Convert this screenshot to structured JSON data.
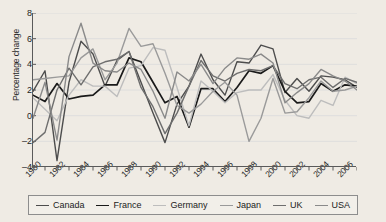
{
  "chart_data": {
    "type": "line",
    "title": "",
    "xlabel": "",
    "ylabel": "Percentage change",
    "xlim": [
      1980,
      2007
    ],
    "ylim": [
      -4,
      8
    ],
    "yticks": [
      -4,
      -2,
      0,
      2,
      4,
      6,
      8
    ],
    "xticks": [
      1980,
      1981,
      1982,
      1983,
      1984,
      1985,
      1986,
      1987,
      1988,
      1989,
      1990,
      1991,
      1992,
      1993,
      1994,
      1995,
      1996,
      1997,
      1998,
      1999,
      2000,
      2001,
      2002,
      2003,
      2004,
      2005,
      2006,
      2007
    ],
    "xtick_labels": [
      "1980",
      "1982",
      "1984",
      "1986",
      "1988",
      "1990",
      "1992",
      "1994",
      "1996",
      "1998",
      "2000",
      "2002",
      "2004",
      "2006"
    ],
    "xtick_label_years": [
      1980,
      1982,
      1984,
      1986,
      1988,
      1990,
      1992,
      1994,
      1996,
      1998,
      2000,
      2002,
      2004,
      2006
    ],
    "grid": "horizontal",
    "legend_position": "bottom",
    "x": [
      1980,
      1981,
      1982,
      1983,
      1984,
      1985,
      1986,
      1987,
      1988,
      1989,
      1990,
      1991,
      1992,
      1993,
      1994,
      1995,
      1996,
      1997,
      1998,
      1999,
      2000,
      2001,
      2002,
      2003,
      2004,
      2005,
      2006,
      2007
    ],
    "series": [
      {
        "name": "Canada",
        "color": "#4d4d4d",
        "values": [
          1.9,
          3.5,
          -3.5,
          2.6,
          5.8,
          4.8,
          2.3,
          4.3,
          5.0,
          2.6,
          0.2,
          -2.1,
          0.9,
          2.3,
          4.8,
          2.8,
          1.6,
          4.2,
          4.1,
          5.5,
          5.2,
          1.8,
          2.9,
          1.9,
          3.1,
          3.0,
          2.8,
          2.2
        ],
        "linewidth": 1.4
      },
      {
        "name": "France",
        "color": "#1a1a1a",
        "values": [
          1.6,
          1.1,
          2.5,
          1.3,
          1.5,
          1.6,
          2.4,
          2.4,
          4.5,
          4.2,
          2.6,
          1.0,
          1.5,
          -0.9,
          2.1,
          2.1,
          1.1,
          2.2,
          3.5,
          3.3,
          3.9,
          1.9,
          1.0,
          1.1,
          2.5,
          1.9,
          2.4,
          2.3
        ],
        "linewidth": 1.7
      },
      {
        "name": "Germany",
        "color": "#bdbdbd",
        "values": [
          1.4,
          0.5,
          -0.4,
          1.6,
          2.8,
          2.3,
          2.3,
          1.5,
          3.7,
          3.9,
          5.3,
          5.1,
          2.2,
          -0.8,
          2.7,
          1.9,
          1.0,
          1.8,
          2.0,
          2.0,
          3.2,
          1.2,
          0.0,
          -0.2,
          1.2,
          0.8,
          3.0,
          2.5
        ],
        "linewidth": 1.4
      },
      {
        "name": "Japan",
        "color": "#9a9a9a",
        "values": [
          2.8,
          2.9,
          3.0,
          3.1,
          4.5,
          5.2,
          2.8,
          4.1,
          6.8,
          5.4,
          5.6,
          3.3,
          0.8,
          0.2,
          0.9,
          1.9,
          2.6,
          1.6,
          -2.0,
          -0.2,
          2.9,
          0.2,
          0.3,
          1.4,
          2.7,
          1.9,
          2.0,
          2.3
        ],
        "linewidth": 1.4
      },
      {
        "name": "UK",
        "color": "#6e6e6e",
        "values": [
          -2.1,
          -1.3,
          2.0,
          3.7,
          2.4,
          3.8,
          4.2,
          4.4,
          5.0,
          2.2,
          0.7,
          -1.4,
          0.2,
          2.3,
          4.3,
          3.1,
          2.7,
          3.3,
          3.6,
          3.5,
          3.9,
          2.5,
          2.1,
          2.8,
          3.0,
          2.2,
          2.9,
          2.6
        ],
        "linewidth": 1.4
      },
      {
        "name": "USA",
        "color": "#8a8a8a",
        "values": [
          -0.2,
          2.6,
          -1.9,
          4.6,
          7.2,
          4.1,
          3.5,
          3.4,
          4.1,
          3.6,
          1.9,
          -0.2,
          3.4,
          2.7,
          4.0,
          2.5,
          3.7,
          4.5,
          4.4,
          4.8,
          4.1,
          1.0,
          1.8,
          2.5,
          3.6,
          3.1,
          2.7,
          2.0
        ],
        "linewidth": 1.4
      }
    ]
  },
  "axis": {
    "ylabel": "Percentage change"
  },
  "legend": {
    "items": [
      {
        "label": "Canada"
      },
      {
        "label": "France"
      },
      {
        "label": "Germany"
      },
      {
        "label": "Japan"
      },
      {
        "label": "UK"
      },
      {
        "label": "USA"
      }
    ]
  }
}
